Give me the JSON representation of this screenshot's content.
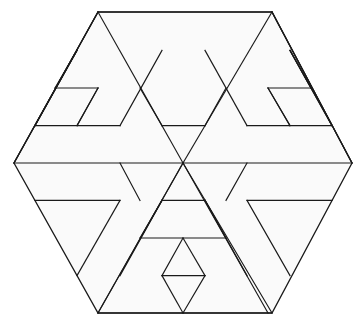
{
  "figure": {
    "name": "hexagon-triangular-grid-pattern",
    "type": "geometric-line-drawing",
    "alt_text": "Regular hexagon subdivided by a triangular grid with nested triangles and diagonal bands",
    "canvas": {
      "width": 362,
      "height": 322
    },
    "colors": {
      "background": "#ffffff",
      "interior_fill": "#fafafa",
      "line": "#1a1a1a"
    },
    "geometry": {
      "center": {
        "x": 183,
        "y": 163
      },
      "units_per_side": 4,
      "row_count": 8,
      "row_height": 37.6,
      "half_cell_width": 21.2,
      "hexagon_vertices": [
        {
          "x": 98,
          "y": 12
        },
        {
          "x": 272,
          "y": 12
        },
        {
          "x": 352,
          "y": 163
        },
        {
          "x": 272,
          "y": 313
        },
        {
          "x": 98,
          "y": 313
        },
        {
          "x": 14,
          "y": 163
        }
      ],
      "rows_y": [
        12,
        50.4,
        88,
        125.6,
        163,
        200.4,
        238,
        275.6,
        313
      ]
    },
    "segments": {
      "horizontal": [
        {
          "name": "h-top-edge",
          "x1": 98,
          "y1": 12,
          "x2": 272,
          "y2": 12
        },
        {
          "name": "h-upper-left-small",
          "x1": 55,
          "y1": 88,
          "x2": 98,
          "y2": 88
        },
        {
          "name": "h-upper-right-small",
          "x1": 268,
          "y1": 88,
          "x2": 311,
          "y2": 88
        },
        {
          "name": "h-left-band-top",
          "x1": 35,
          "y1": 125.6,
          "x2": 120,
          "y2": 125.6
        },
        {
          "name": "h-center-upper",
          "x1": 162,
          "y1": 125.6,
          "x2": 205,
          "y2": 125.6
        },
        {
          "name": "h-right-band-top",
          "x1": 247,
          "y1": 125.6,
          "x2": 332,
          "y2": 125.6
        },
        {
          "name": "h-middle-left",
          "x1": 14,
          "y1": 163,
          "x2": 183,
          "y2": 163
        },
        {
          "name": "h-middle-right",
          "x1": 183,
          "y1": 163,
          "x2": 352,
          "y2": 163
        },
        {
          "name": "h-lower-left-band",
          "x1": 35,
          "y1": 200.4,
          "x2": 120,
          "y2": 200.4
        },
        {
          "name": "h-center-lower",
          "x1": 162,
          "y1": 200.4,
          "x2": 205,
          "y2": 200.4
        },
        {
          "name": "h-lower-right-band",
          "x1": 247,
          "y1": 200.4,
          "x2": 332,
          "y2": 200.4
        },
        {
          "name": "h-bottom-center-upper",
          "x1": 140,
          "y1": 238,
          "x2": 226,
          "y2": 238
        },
        {
          "name": "h-bottom-center-lower",
          "x1": 162,
          "y1": 275.6,
          "x2": 205,
          "y2": 275.6
        },
        {
          "name": "h-bottom-edge",
          "x1": 98,
          "y1": 313,
          "x2": 272,
          "y2": 313
        }
      ],
      "diagonal_down_right": [
        {
          "name": "d1-left-upper-edge",
          "x1": 14,
          "y1": 163,
          "x2": 98,
          "y2": 12
        },
        {
          "name": "d1-a",
          "x1": 35,
          "y1": 125.6,
          "x2": 77,
          "y2": 50.4
        },
        {
          "name": "d1-b",
          "x1": 55,
          "y1": 88,
          "x2": 77,
          "y2": 50.4
        },
        {
          "name": "d1-c",
          "x1": 77,
          "y1": 125.6,
          "x2": 98,
          "y2": 88
        },
        {
          "name": "d1-d",
          "x1": 98,
          "y1": 313,
          "x2": 183,
          "y2": 163
        },
        {
          "name": "d1-e",
          "x1": 120,
          "y1": 275.6,
          "x2": 162,
          "y2": 200.4
        },
        {
          "name": "d1-f",
          "x1": 140,
          "y1": 238,
          "x2": 162,
          "y2": 200.4
        },
        {
          "name": "d1-g",
          "x1": 162,
          "y1": 275.6,
          "x2": 183,
          "y2": 238
        },
        {
          "name": "d1-h",
          "x1": 183,
          "y1": 313,
          "x2": 205,
          "y2": 275.6
        },
        {
          "name": "d1-i",
          "x1": 98,
          "y1": 12,
          "x2": 183,
          "y2": 163
        },
        {
          "name": "d1-j",
          "x1": 120,
          "y1": 125.6,
          "x2": 162,
          "y2": 50.4
        },
        {
          "name": "d1-k",
          "x1": 205,
          "y1": 125.6,
          "x2": 226,
          "y2": 88
        },
        {
          "name": "d1-l",
          "x1": 226,
          "y1": 200.4,
          "x2": 247,
          "y2": 163
        },
        {
          "name": "d1-m",
          "x1": 183,
          "y1": 163,
          "x2": 268,
          "y2": 313
        },
        {
          "name": "d1-n",
          "x1": 247,
          "y1": 200.4,
          "x2": 290,
          "y2": 275.6
        },
        {
          "name": "d1-o",
          "x1": 268,
          "y1": 88,
          "x2": 290,
          "y2": 125.6
        },
        {
          "name": "d1-p",
          "x1": 290,
          "y1": 50.4,
          "x2": 332,
          "y2": 125.6
        },
        {
          "name": "d1-q",
          "x1": 272,
          "y1": 12,
          "x2": 352,
          "y2": 163
        }
      ],
      "diagonal_down_left": [
        {
          "name": "d2-right-upper-edge",
          "x1": 352,
          "y1": 163,
          "x2": 272,
          "y2": 12
        },
        {
          "name": "d2-a",
          "x1": 332,
          "y1": 125.6,
          "x2": 290,
          "y2": 50.4
        },
        {
          "name": "d2-b",
          "x1": 311,
          "y1": 88,
          "x2": 290,
          "y2": 50.4
        },
        {
          "name": "d2-c",
          "x1": 290,
          "y1": 125.6,
          "x2": 268,
          "y2": 88
        },
        {
          "name": "d2-d",
          "x1": 272,
          "y1": 313,
          "x2": 183,
          "y2": 163
        },
        {
          "name": "d2-e",
          "x1": 247,
          "y1": 275.6,
          "x2": 205,
          "y2": 200.4
        },
        {
          "name": "d2-f",
          "x1": 226,
          "y1": 238,
          "x2": 205,
          "y2": 200.4
        },
        {
          "name": "d2-g",
          "x1": 205,
          "y1": 275.6,
          "x2": 183,
          "y2": 238
        },
        {
          "name": "d2-h",
          "x1": 183,
          "y1": 313,
          "x2": 162,
          "y2": 275.6
        },
        {
          "name": "d2-i",
          "x1": 272,
          "y1": 12,
          "x2": 183,
          "y2": 163
        },
        {
          "name": "d2-j",
          "x1": 247,
          "y1": 125.6,
          "x2": 205,
          "y2": 50.4
        },
        {
          "name": "d2-k",
          "x1": 162,
          "y1": 125.6,
          "x2": 140,
          "y2": 88
        },
        {
          "name": "d2-l",
          "x1": 140,
          "y1": 200.4,
          "x2": 120,
          "y2": 163
        },
        {
          "name": "d2-m",
          "x1": 183,
          "y1": 163,
          "x2": 98,
          "y2": 313
        },
        {
          "name": "d2-n",
          "x1": 120,
          "y1": 200.4,
          "x2": 77,
          "y2": 275.6
        },
        {
          "name": "d2-o",
          "x1": 98,
          "y1": 88,
          "x2": 77,
          "y2": 125.6
        },
        {
          "name": "d2-p",
          "x1": 77,
          "y1": 50.4,
          "x2": 35,
          "y2": 125.6
        },
        {
          "name": "d2-q",
          "x1": 98,
          "y1": 12,
          "x2": 14,
          "y2": 163
        }
      ]
    }
  }
}
